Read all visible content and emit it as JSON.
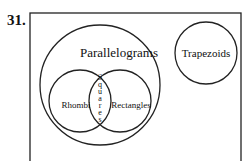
{
  "problem_number": "31.",
  "diagram": {
    "type": "venn",
    "sets": {
      "outer_box": "",
      "parallelograms": "Parallelograms",
      "rhombi": "Rhombi",
      "rectangles": "Rectangles",
      "squares": "Squares",
      "trapezoids": "Trapezoids"
    },
    "squares_letters": [
      "S",
      "q",
      "u",
      "a",
      "r",
      "e",
      "s"
    ]
  }
}
